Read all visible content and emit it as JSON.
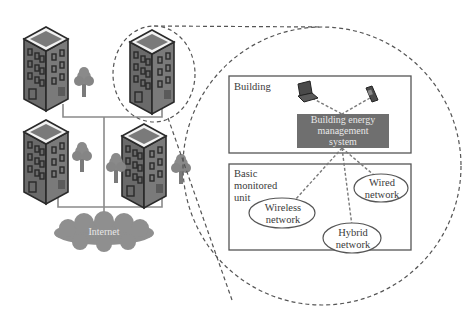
{
  "diagram": {
    "type": "network-architecture",
    "colors": {
      "building_body": "#6e6e6e",
      "building_outline": "#2a2a2a",
      "building_roof": "#7a7a7a",
      "roof_border": "#f2f2f2",
      "window": "#4a4a4a",
      "tree": "#858585",
      "wire": "#8a8a8a",
      "internet_cloud": "#8f8f8f",
      "bems_box": "#6f6f6f",
      "box_border": "#555555",
      "dashed": "#555555"
    },
    "left_scene": {
      "buildings": [
        {
          "id": "building-top-left"
        },
        {
          "id": "building-top-right",
          "highlighted": true
        },
        {
          "id": "building-bottom-left"
        },
        {
          "id": "building-bottom-right"
        }
      ],
      "trees": 4,
      "internet_label": "Internet"
    },
    "zoom_detail": {
      "building_panel": {
        "title": "Building",
        "devices": [
          "laptop-icon",
          "mobile-phone-icon"
        ],
        "bems_label_line1": "Building energy",
        "bems_label_line2": "management",
        "bems_label_line3": "system"
      },
      "unit_panel": {
        "title_line1": "Basic",
        "title_line2": "monitored",
        "title_line3": "unit",
        "networks": [
          {
            "line1": "Wireless",
            "line2": "network"
          },
          {
            "line1": "Wired",
            "line2": "network"
          },
          {
            "line1": "Hybrid",
            "line2": "network"
          }
        ]
      }
    }
  }
}
